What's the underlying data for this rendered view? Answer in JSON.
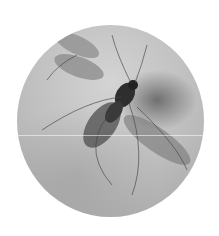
{
  "image": {
    "alt": "Grayscale circular close-up illustration of a winged insect (gnat) on a textured background",
    "subject": "insect",
    "colors": {
      "background": "#ffffff",
      "disc_light": "#d4d4d4",
      "disc_mid": "#bdbdbd",
      "disc_dark": "#a5a5a5",
      "insect_body": "#2e2e2e",
      "wing": "#7a7a7a"
    }
  }
}
